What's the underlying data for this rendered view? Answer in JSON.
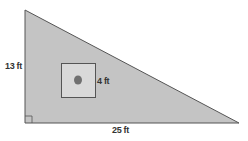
{
  "diagram": {
    "type": "right-triangle-with-square-cutout",
    "triangle": {
      "height_label": "13 ft",
      "base_label": "25 ft",
      "right_angle_marker": true,
      "fill": "#c4c4c4",
      "stroke": "#555555"
    },
    "square": {
      "side_label": "4 ft",
      "fill": "#d9d9d9",
      "stroke": "#555555",
      "center_mark_color": "#707070"
    }
  }
}
